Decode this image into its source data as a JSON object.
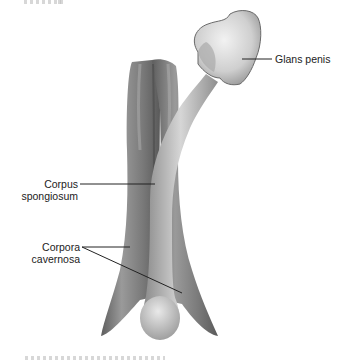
{
  "figure": {
    "top_caption_fragment": "",
    "bottom_caption_fragment": "",
    "colors": {
      "background": "#ffffff",
      "tissue_dark": "#6f6f6f",
      "tissue_mid": "#8c8c8c",
      "tissue_light": "#cfcfcf",
      "glans": "#d9d9d9",
      "leader_line": "#222222",
      "text": "#222222"
    }
  },
  "labels": {
    "glans": "Glans penis",
    "spongiosum_line1": "Corpus",
    "spongiosum_line2": "spongiosum",
    "cavernosa_line1": "Corpora",
    "cavernosa_line2": "cavernosa"
  }
}
